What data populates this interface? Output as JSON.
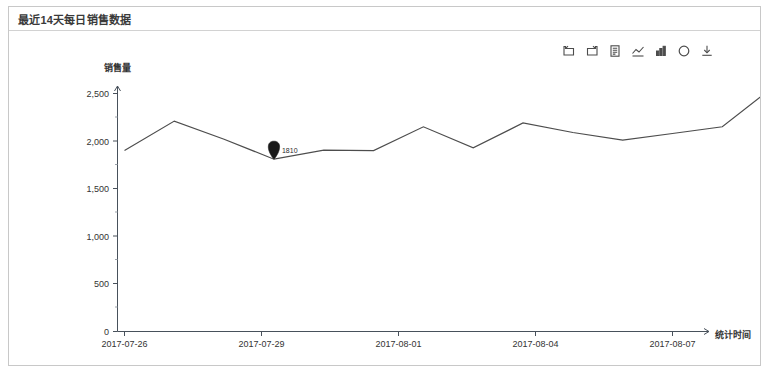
{
  "panel": {
    "title": "最近14天每日销售数据"
  },
  "toolbox": {
    "items": [
      {
        "name": "undo-icon",
        "label": "撤销"
      },
      {
        "name": "redo-icon",
        "label": "重做"
      },
      {
        "name": "data-view-icon",
        "label": "数据视图"
      },
      {
        "name": "line-chart-icon",
        "label": "切换为折线图"
      },
      {
        "name": "bar-chart-icon",
        "label": "切换为柱状图"
      },
      {
        "name": "restore-icon",
        "label": "还原"
      },
      {
        "name": "save-image-icon",
        "label": "保存为图片"
      }
    ]
  },
  "chart_data": {
    "type": "line",
    "title": "最近14天每日销售数据",
    "xlabel": "统计时间",
    "ylabel": "销售量",
    "x": [
      "2017-07-26",
      "2017-07-27",
      "2017-07-28",
      "2017-07-29",
      "2017-07-30",
      "2017-07-31",
      "2017-08-01",
      "2017-08-02",
      "2017-08-03",
      "2017-08-04",
      "2017-08-05",
      "2017-08-06",
      "2017-08-07",
      "2017-08-08"
    ],
    "tick_labels": [
      "2017-07-26",
      "2017-07-29",
      "2017-08-01",
      "2017-08-04",
      "2017-08-07"
    ],
    "y_ticks": [
      "0",
      "500",
      "1,000",
      "1,500",
      "2,000",
      "2,500"
    ],
    "y_tick_values": [
      0,
      500,
      1000,
      1500,
      2000,
      2500
    ],
    "ylim": [
      0,
      2500
    ],
    "grid": false,
    "legend": "none",
    "series": [
      {
        "name": "销售量",
        "color": "#4d4d4d",
        "values": [
          1900,
          2210,
          2020,
          1810,
          1905,
          1900,
          2150,
          1930,
          2190,
          2090,
          2010,
          2080,
          2150,
          2560
        ]
      }
    ],
    "annotations": [
      {
        "type": "min",
        "x": "2017-07-29",
        "value": 1810,
        "label": "1810"
      },
      {
        "type": "max",
        "x": "2017-08-08",
        "value": 2560,
        "label": "2560"
      }
    ]
  }
}
